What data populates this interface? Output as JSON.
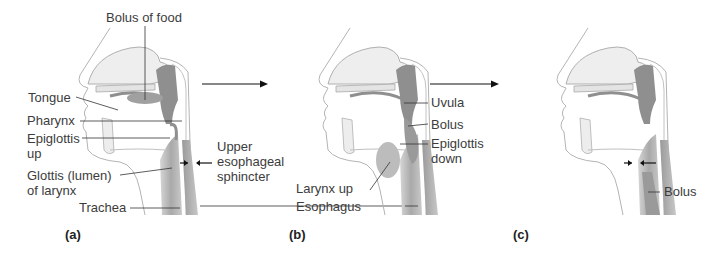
{
  "figure": {
    "colors": {
      "outline": "#b0b0b0",
      "tissue_light": "#ececec",
      "tissue_mid": "#c4c4c4",
      "tissue_dark": "#8f8f8f",
      "leader_line": "#333333",
      "text": "#3c3c3c"
    },
    "panels": [
      {
        "id": "a",
        "letter": "(a)",
        "labels": {
          "bolus_of_food": "Bolus of food",
          "tongue": "Tongue",
          "pharynx": "Pharynx",
          "epiglottis_up_1": "Epiglottis",
          "epiglottis_up_2": "up",
          "glottis_1": "Glottis (lumen)",
          "glottis_2": "of larynx",
          "trachea": "Trachea",
          "ues_1": "Upper",
          "ues_2": "esophageal",
          "ues_3": "sphincter"
        }
      },
      {
        "id": "b",
        "letter": "(b)",
        "labels": {
          "uvula": "Uvula",
          "bolus": "Bolus",
          "epiglottis_down_1": "Epiglottis",
          "epiglottis_down_2": "down",
          "larynx_up": "Larynx up",
          "esophagus": "Esophagus"
        }
      },
      {
        "id": "c",
        "letter": "(c)",
        "labels": {
          "bolus": "Bolus"
        }
      }
    ],
    "arrows": [
      {
        "name": "stage-arrow-a-to-b",
        "direction": "right"
      },
      {
        "name": "stage-arrow-b-to-c",
        "direction": "right"
      }
    ]
  }
}
